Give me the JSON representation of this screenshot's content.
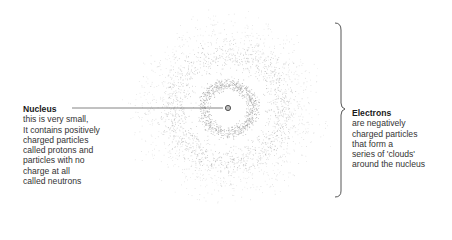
{
  "diagram": {
    "nucleus": {
      "title": "Nucleus",
      "lines": [
        "this is very small,",
        "It contains positively",
        "charged particles",
        "called protons and",
        "particles with no",
        "charge at all",
        "called neutrons"
      ]
    },
    "electrons": {
      "title": "Electrons",
      "lines": [
        "are negatively",
        "charged particles",
        "that form a",
        "series of 'clouds'",
        "around the nucleus"
      ]
    },
    "colors": {
      "dots": "#8a8a8a",
      "line": "#555555",
      "nucleus": "#666666",
      "text": "#333333"
    }
  }
}
